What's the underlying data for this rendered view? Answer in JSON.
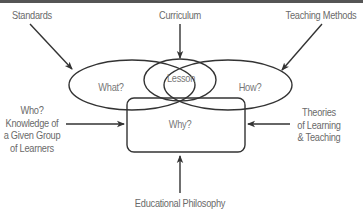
{
  "diagram": {
    "title": "",
    "inputs": {
      "standards": "Standards",
      "curriculum": "Curriculum",
      "teaching_methods": "Teaching Methods",
      "who": [
        "Who?",
        "Knowledge of",
        "a Given Group",
        "of Learners"
      ],
      "theories": [
        "Theories",
        "of Learning",
        "& Teaching"
      ],
      "philosophy": "Educational Philosophy"
    },
    "nodes": {
      "what": "What?",
      "lesson": "Lesson",
      "how": "How?",
      "why": "Why?"
    },
    "edges": [
      {
        "from": "Standards",
        "to": "What?"
      },
      {
        "from": "Curriculum",
        "to": "Lesson"
      },
      {
        "from": "Teaching Methods",
        "to": "How?"
      },
      {
        "from": "Who? Knowledge of a Given Group of Learners",
        "to": "Why?"
      },
      {
        "from": "Theories of Learning & Teaching",
        "to": "Why?"
      },
      {
        "from": "Educational Philosophy",
        "to": "Why?"
      }
    ],
    "colors": {
      "line": "#333333",
      "text": "#6a6a6a",
      "top_border": "#555555"
    }
  }
}
